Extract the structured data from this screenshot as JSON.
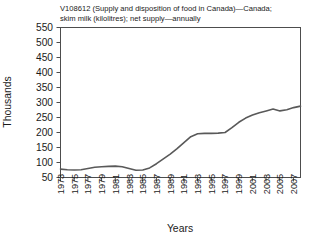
{
  "chart_data": {
    "type": "line",
    "title": "V108612 (Supply and disposition of food in Canada)—Canada; skim milk (kilolitres); net supply—annually",
    "title_line1": "V108612 (Supply and disposition of food in Canada)—Canada;",
    "title_line2": "skim milk (kilolitres); net supply—annually",
    "xlabel": "Years",
    "ylabel": "Thousands",
    "ylim": [
      50,
      550
    ],
    "yticks": [
      50,
      100,
      150,
      200,
      250,
      300,
      350,
      400,
      450,
      500,
      550
    ],
    "ytick_labels": [
      "50",
      "100",
      "150",
      "200",
      "250",
      "300",
      "350",
      "400",
      "450",
      "500",
      "550"
    ],
    "xlim": [
      1973,
      2008
    ],
    "xticks": [
      1973,
      1975,
      1977,
      1979,
      1981,
      1983,
      1985,
      1987,
      1989,
      1991,
      1993,
      1995,
      1997,
      1999,
      2001,
      2003,
      2005,
      2007
    ],
    "xtick_labels": [
      "1973",
      "1975",
      "1977",
      "1979",
      "1981",
      "1983",
      "1985",
      "1987",
      "1989",
      "1991",
      "1993",
      "1995",
      "1997",
      "1999",
      "2001",
      "2003",
      "2005",
      "2007"
    ],
    "grid": false,
    "legend": "none",
    "line_color": "#595959",
    "frame_color": "#4d4d4d",
    "background": "#ffffff",
    "x": [
      1973,
      1974,
      1975,
      1976,
      1977,
      1978,
      1979,
      1980,
      1981,
      1982,
      1983,
      1984,
      1985,
      1986,
      1987,
      1988,
      1989,
      1990,
      1991,
      1992,
      1993,
      1994,
      1995,
      1996,
      1997,
      1998,
      1999,
      2000,
      2001,
      2002,
      2003,
      2004,
      2005,
      2006,
      2007,
      2008
    ],
    "series": [
      {
        "name": "Skim milk net supply",
        "values": [
          78,
          76,
          75,
          76,
          80,
          84,
          86,
          87,
          88,
          86,
          80,
          74,
          75,
          82,
          96,
          112,
          128,
          146,
          166,
          186,
          196,
          197,
          197,
          198,
          200,
          216,
          234,
          248,
          258,
          266,
          272,
          278,
          272,
          276,
          283,
          288
        ]
      }
    ]
  }
}
